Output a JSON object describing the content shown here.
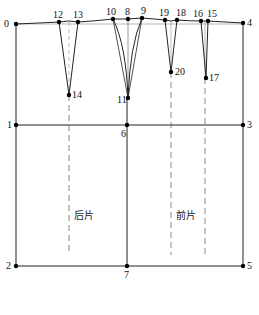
{
  "diagram": {
    "type": "garment-pattern-draft",
    "colors": {
      "line": "#222222",
      "dash": "#555555",
      "point": "#000000",
      "background": "#ffffff"
    },
    "points": [
      {
        "id": "0",
        "x": 16,
        "y": 24,
        "lx": 4,
        "ly": 19
      },
      {
        "id": "1",
        "x": 16,
        "y": 125,
        "lx": 7,
        "ly": 120
      },
      {
        "id": "2",
        "x": 16,
        "y": 266,
        "lx": 6,
        "ly": 261
      },
      {
        "id": "3",
        "x": 243,
        "y": 125,
        "lx": 247,
        "ly": 120
      },
      {
        "id": "4",
        "x": 243,
        "y": 23,
        "lx": 247,
        "ly": 18
      },
      {
        "id": "5",
        "x": 243,
        "y": 266,
        "lx": 247,
        "ly": 261
      },
      {
        "id": "6",
        "x": 127,
        "y": 125,
        "lx": 121,
        "ly": 129
      },
      {
        "id": "7",
        "x": 127,
        "y": 266,
        "lx": 124,
        "ly": 270
      },
      {
        "id": "8",
        "x": 128,
        "y": 19,
        "lx": 125,
        "ly": 7
      },
      {
        "id": "9",
        "x": 142,
        "y": 18,
        "lx": 141,
        "ly": 6
      },
      {
        "id": "10",
        "x": 113,
        "y": 19,
        "lx": 106,
        "ly": 7
      },
      {
        "id": "11",
        "x": 128,
        "y": 98,
        "lx": 117,
        "ly": 95
      },
      {
        "id": "12",
        "x": 59,
        "y": 22,
        "lx": 53,
        "ly": 10
      },
      {
        "id": "13",
        "x": 78,
        "y": 22,
        "lx": 73,
        "ly": 10
      },
      {
        "id": "14",
        "x": 69,
        "y": 95,
        "lx": 72,
        "ly": 90
      },
      {
        "id": "15",
        "x": 208,
        "y": 21,
        "lx": 207,
        "ly": 9
      },
      {
        "id": "16",
        "x": 201,
        "y": 21,
        "lx": 193,
        "ly": 9
      },
      {
        "id": "17",
        "x": 206,
        "y": 78,
        "lx": 209,
        "ly": 73
      },
      {
        "id": "18",
        "x": 177,
        "y": 20,
        "lx": 176,
        "ly": 8
      },
      {
        "id": "19",
        "x": 165,
        "y": 20,
        "lx": 159,
        "ly": 8
      },
      {
        "id": "20",
        "x": 171,
        "y": 72,
        "lx": 175,
        "ly": 67
      }
    ],
    "labels": {
      "back_piece": "后片",
      "front_piece": "前片"
    }
  }
}
